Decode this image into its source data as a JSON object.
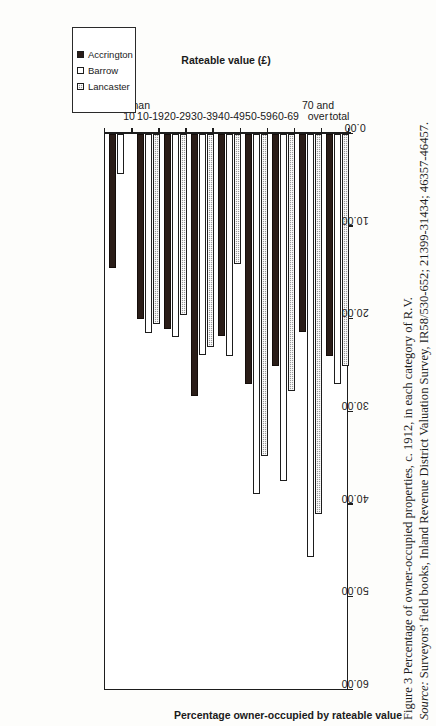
{
  "figure": {
    "caption_line_1": "Figure 3 Percentage of owner-occupied properties, c. 1912, in each category of R.V.",
    "caption_source_label": "Source:",
    "caption_line_2_rest": " Surveyors' field books, Inland Revenue District Valuation Survey, IR58/530-652; 21399-31434; 46357-46457."
  },
  "legend": {
    "items": [
      {
        "label": "Accrington",
        "swatch": "filled-black",
        "color": "#2a1d18"
      },
      {
        "label": "Barrow",
        "swatch": "empty-white",
        "color": "#ffffff"
      },
      {
        "label": "Lancaster",
        "swatch": "hatched-grey",
        "color": "#9a9a9a"
      }
    ]
  },
  "chart_data": {
    "type": "bar",
    "orientation": "horizontal",
    "title": "Figure 3 Percentage of owner-occupied properties, c. 1912, in each category of R.V.",
    "xlabel": "Percentage owner-occupied by rateable value",
    "ylabel": "Rateable value (£)",
    "categories": [
      "less than\n10",
      "10-19",
      "20-29",
      "30-39",
      "40-49",
      "50-59",
      "60-69",
      "70 and\nover",
      "total"
    ],
    "category_labels_flat": [
      "less than 10",
      "10-19",
      "20-29",
      "30-39",
      "40-49",
      "50-59",
      "60-69",
      "70 and over",
      "total"
    ],
    "series": [
      {
        "name": "Accrington",
        "values": [
          14.5,
          20.0,
          21.0,
          28.3,
          21.8,
          27.0,
          25.0,
          21.4,
          24.0
        ]
      },
      {
        "name": "Barrow",
        "values": [
          4.3,
          21.5,
          21.9,
          23.8,
          24.0,
          38.8,
          37.4,
          45.6,
          27.0
        ]
      },
      {
        "name": "Lancaster",
        "values": [
          0.0,
          20.5,
          19.5,
          23.0,
          14.0,
          34.7,
          27.7,
          41.0,
          25.0
        ]
      }
    ],
    "value_axis_ticks": [
      "0.00",
      "10.00",
      "20.00",
      "30.00",
      "40.00",
      "50.00",
      "60.00"
    ],
    "value_axis_tick_values": [
      0,
      10,
      20,
      30,
      40,
      50,
      60
    ],
    "xlim": [
      0,
      60
    ],
    "grid": false,
    "legend_position": "top-right"
  }
}
